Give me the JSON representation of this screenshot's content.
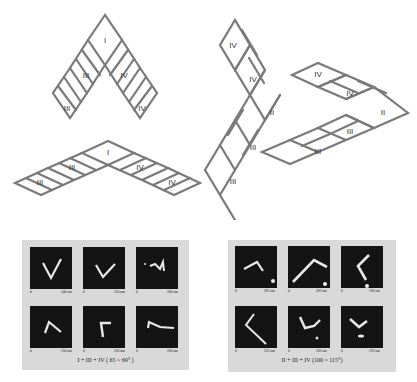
{
  "schematics": {
    "top_left_labels": [
      "I",
      "III",
      "IV",
      "III",
      "IV"
    ],
    "bottom_left_labels": [
      "I",
      "III",
      "IV",
      "III",
      "IV"
    ],
    "left_vertical_labels": [
      "IV",
      "IV",
      "II",
      "III",
      "III"
    ],
    "right_horizontal_labels": [
      "IV",
      "IV",
      "II",
      "III",
      "III"
    ]
  },
  "afm_panels": [
    {
      "caption": "I + III + IV ( 65 ~ 69° )",
      "tiles": [
        {
          "start": "0",
          "end": "240 nm"
        },
        {
          "start": "0",
          "end": "250 nm"
        },
        {
          "start": "0",
          "end": "180 nm"
        },
        {
          "start": "0",
          "end": "250 nm"
        },
        {
          "start": "0",
          "end": "250 nm"
        },
        {
          "start": "0",
          "end": "160 nm"
        }
      ]
    },
    {
      "caption": "II + III + IV (100 ~ 115°)",
      "tiles": [
        {
          "start": "0",
          "end": "263 nm"
        },
        {
          "start": "0",
          "end": "269 nm"
        },
        {
          "start": "0",
          "end": "190 nm"
        },
        {
          "start": "0",
          "end": "333 nm"
        },
        {
          "start": "0",
          "end": "236 nm"
        },
        {
          "start": "0",
          "end": "239 nm"
        }
      ]
    }
  ]
}
